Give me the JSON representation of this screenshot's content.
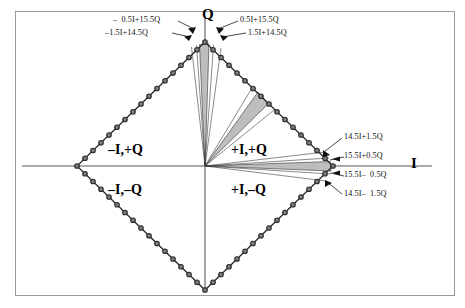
{
  "figure": {
    "type": "constellation-quadrant-diagram",
    "axes": {
      "horizontal_label": "I",
      "vertical_label": "Q"
    },
    "quadrants": [
      {
        "name": "upper-left",
        "label": "–I,+Q"
      },
      {
        "name": "upper-right",
        "label": "+I,+Q"
      },
      {
        "name": "lower-left",
        "label": "–I,–Q"
      },
      {
        "name": "lower-right",
        "label": "+I,–Q"
      }
    ],
    "annotations": [
      {
        "name": "top-left-outer",
        "text": "–  0.5I+15.5Q"
      },
      {
        "name": "top-left-inner",
        "text": "–1.5I+14.5Q"
      },
      {
        "name": "top-right-outer",
        "text": "0.5I+15.5Q"
      },
      {
        "name": "top-right-inner",
        "text": "1.5I+14.5Q"
      },
      {
        "name": "right-upper-outer",
        "text": "14.5I+1.5Q"
      },
      {
        "name": "right-upper-inner",
        "text": "15.5I+0.5Q"
      },
      {
        "name": "right-lower-inner",
        "text": "15.5I–  0.5Q"
      },
      {
        "name": "right-lower-outer",
        "text": "14.5I–  1.5Q"
      }
    ],
    "colors": {
      "frame": "#9a9a9a",
      "axis": "#8d8d8d",
      "constellation_outline": "#2b2b2b",
      "constellation_point_fill": "#7d7d7d",
      "wedge_fill": "#bdbdbd",
      "wedge_stroke": "#555555",
      "text": "#111111"
    },
    "geometry": {
      "center": {
        "x": 205,
        "y": 166
      },
      "radius_x": 128,
      "radius_y": 124,
      "points_per_edge": 16
    }
  },
  "chart_data": {
    "type": "scatter",
    "title": "",
    "xlabel": "I",
    "ylabel": "Q",
    "grid": false,
    "legend": null,
    "xlim": [
      -16,
      16
    ],
    "ylim": [
      -16,
      16
    ],
    "quadrant_labels": [
      "–I,+Q",
      "+I,+Q",
      "–I,–Q",
      "+I,–Q"
    ],
    "annotated_symbols": [
      {
        "label": "–  0.5I+15.5Q",
        "I": -0.5,
        "Q": 15.5
      },
      {
        "label": "–1.5I+14.5Q",
        "I": -1.5,
        "Q": 14.5
      },
      {
        "label": "0.5I+15.5Q",
        "I": 0.5,
        "Q": 15.5
      },
      {
        "label": "1.5I+14.5Q",
        "I": 1.5,
        "Q": 14.5
      },
      {
        "label": "14.5I+1.5Q",
        "I": 14.5,
        "Q": 1.5
      },
      {
        "label": "15.5I+0.5Q",
        "I": 15.5,
        "Q": 0.5
      },
      {
        "label": "15.5I–  0.5Q",
        "I": 15.5,
        "Q": -0.5
      },
      {
        "label": "14.5I–  1.5Q",
        "I": 14.5,
        "Q": -1.5
      }
    ]
  }
}
